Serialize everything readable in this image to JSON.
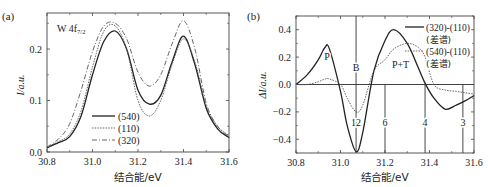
{
  "chart_data": [
    {
      "panel_label": "(a)",
      "type": "line",
      "annotation": "W 4f7/2",
      "annotation_main": "W 4f",
      "annotation_sub": "7/2",
      "xlabel": "结合能/eV",
      "ylabel": "I/a.u.",
      "xlim": [
        30.8,
        31.6
      ],
      "ylim": [
        0.0,
        0.27
      ],
      "xticks": [
        "30.8",
        "31.0",
        "31.2",
        "31.4",
        "31.6"
      ],
      "yticks": [
        "0.0",
        "0.1",
        "0.2"
      ],
      "legend_position": "lower center",
      "grid": false,
      "x": [
        30.8,
        30.85,
        30.9,
        30.95,
        31.0,
        31.05,
        31.1,
        31.15,
        31.2,
        31.25,
        31.3,
        31.35,
        31.4,
        31.45,
        31.5,
        31.55,
        31.6
      ],
      "series": [
        {
          "name": "(540)",
          "style": "solid",
          "values": [
            0.008,
            0.018,
            0.03,
            0.07,
            0.15,
            0.215,
            0.235,
            0.2,
            0.12,
            0.093,
            0.11,
            0.175,
            0.225,
            0.17,
            0.085,
            0.045,
            0.028
          ]
        },
        {
          "name": "(110)",
          "style": "dotted",
          "values": [
            0.01,
            0.02,
            0.035,
            0.08,
            0.165,
            0.235,
            0.245,
            0.2,
            0.1,
            0.07,
            0.1,
            0.17,
            0.22,
            0.175,
            0.09,
            0.05,
            0.032
          ]
        },
        {
          "name": "(320)",
          "style": "dashdot",
          "values": [
            0.01,
            0.025,
            0.055,
            0.12,
            0.195,
            0.245,
            0.25,
            0.22,
            0.155,
            0.128,
            0.15,
            0.21,
            0.255,
            0.2,
            0.095,
            0.05,
            0.03
          ]
        }
      ]
    },
    {
      "panel_label": "(b)",
      "type": "line",
      "xlabel": "结合能/eV",
      "ylabel": "ΔI/a.u.",
      "xlim": [
        30.8,
        31.6
      ],
      "ylim": [
        -0.5,
        0.5
      ],
      "xticks": [
        "30.8",
        "31.0",
        "31.2",
        "31.4",
        "31.6"
      ],
      "yticks": [
        "0.4",
        "0.2",
        "0.0",
        "-0.2",
        "-0.4"
      ],
      "legend_position": "upper right",
      "grid": false,
      "x": [
        30.8,
        30.85,
        30.9,
        30.93,
        30.95,
        31.0,
        31.03,
        31.07,
        31.1,
        31.15,
        31.2,
        31.24,
        31.3,
        31.35,
        31.38,
        31.42,
        31.47,
        31.52,
        31.56,
        31.6
      ],
      "series": [
        {
          "name": "(320)-(110)",
          "sublabel": "(差谱)",
          "style": "solid",
          "values": [
            0.0,
            0.07,
            0.18,
            0.27,
            0.26,
            -0.05,
            -0.3,
            -0.49,
            -0.35,
            0.1,
            0.32,
            0.4,
            0.3,
            0.12,
            0.01,
            -0.1,
            -0.18,
            -0.15,
            -0.12,
            -0.08
          ]
        },
        {
          "name": "(540)-(110)",
          "sublabel": "(差谱)",
          "style": "dotted",
          "values": [
            0.0,
            0.0,
            0.02,
            0.04,
            0.04,
            0.0,
            -0.1,
            -0.2,
            -0.15,
            0.1,
            0.18,
            0.26,
            0.3,
            0.27,
            0.2,
            0.0,
            -0.04,
            -0.05,
            -0.06,
            -0.07
          ]
        }
      ],
      "annotations": [
        {
          "text": "P",
          "x": 30.94,
          "y": 0.18
        },
        {
          "text": "B",
          "x": 31.07,
          "y": 0.1
        },
        {
          "text": "P+T",
          "x": 31.27,
          "y": 0.12
        }
      ],
      "vertical_markers": [
        {
          "x": 31.07,
          "label": "12"
        },
        {
          "x": 31.2,
          "label": "6"
        },
        {
          "x": 31.38,
          "label": "4"
        },
        {
          "x": 31.55,
          "label": "3"
        }
      ]
    }
  ]
}
